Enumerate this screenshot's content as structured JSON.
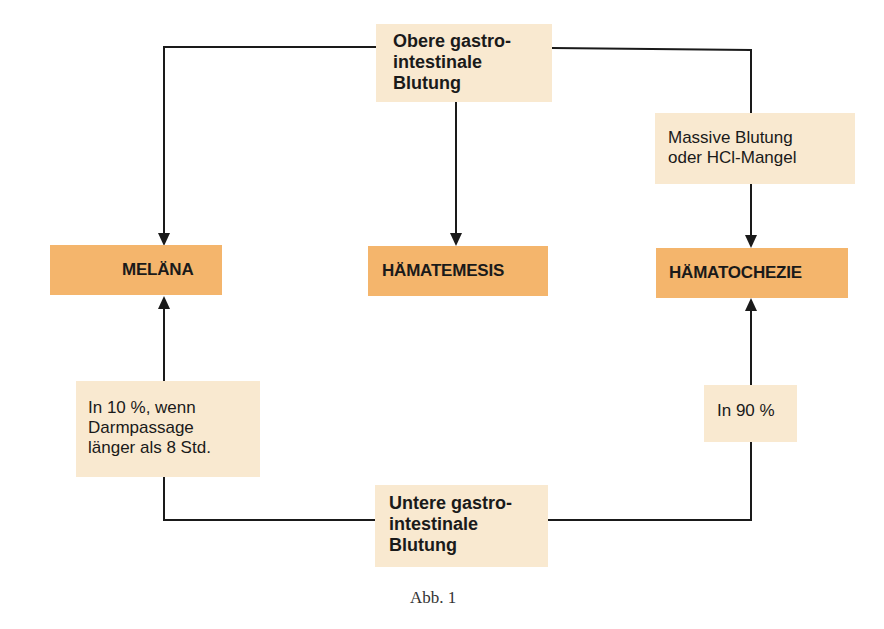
{
  "diagram": {
    "top_source": {
      "line1": "Obere gastro-",
      "line2": "intestinale",
      "line3": "Blutung"
    },
    "bottom_source": {
      "line1": "Untere gastro-",
      "line2": "intestinale",
      "line3": "Blutung"
    },
    "outcomes": {
      "left": "MELÄNA",
      "center": "HÄMATEMESIS",
      "right": "HÄMATOCHEZIE"
    },
    "conditions": {
      "upper_right": {
        "line1": "Massive Blutung",
        "line2": "oder HCl-Mangel"
      },
      "lower_left": {
        "line1": "In 10 %, wenn",
        "line2": "Darmpassage",
        "line3": "länger als 8 Std."
      },
      "lower_right": {
        "line1": "In 90 %"
      }
    },
    "colors": {
      "beige": "#f9e9d0",
      "orange": "#f4b56c",
      "line": "#1a1a1a"
    }
  },
  "caption": "Abb. 1"
}
